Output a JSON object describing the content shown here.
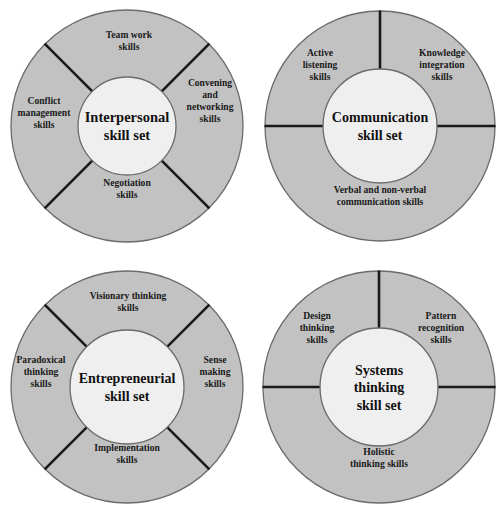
{
  "figure": {
    "kind": "skill-set-wheel-diagrams",
    "count": 4,
    "colors": {
      "ring_fill": "#c2c2c2",
      "hub_fill": "#efefef",
      "outline": "#6b6b6b",
      "divider": "#1a1a1a",
      "text": "#111111",
      "background": "#ffffff"
    }
  },
  "diagrams": [
    {
      "id": "interpersonal",
      "center_title": "Interpersonal",
      "center_subtitle": "skill set",
      "center_font_size": 14.5,
      "outer_radius": 116,
      "inner_radius": 49,
      "cx": 127,
      "cy": 126,
      "divider_angles": [
        45,
        135,
        225,
        315
      ],
      "segments": [
        {
          "name": "team-work",
          "lines": [
            "Team work",
            "skills"
          ]
        },
        {
          "name": "convening-networking",
          "lines": [
            "Convening",
            "and",
            "networking",
            "skills"
          ]
        },
        {
          "name": "negotiation",
          "lines": [
            "Negotiation",
            "skills"
          ]
        },
        {
          "name": "conflict-management",
          "lines": [
            "Conflict",
            "management",
            "skills"
          ]
        }
      ]
    },
    {
      "id": "communication",
      "center_title": "Communication",
      "center_subtitle": "skill set",
      "center_font_size": 14,
      "outer_radius": 115,
      "inner_radius": 57,
      "cx": 128,
      "cy": 126,
      "divider_angles": [
        90,
        180,
        0
      ],
      "segments": [
        {
          "name": "active-listening",
          "lines": [
            "Active",
            "listening",
            "skills"
          ]
        },
        {
          "name": "knowledge-integration",
          "lines": [
            "Knowledge",
            "integration",
            "skills"
          ]
        },
        {
          "name": "verbal-non-verbal-communication",
          "lines": [
            "Verbal and non-verbal",
            "communication skills"
          ]
        }
      ]
    },
    {
      "id": "entrepreneurial",
      "center_title": "Entrepreneurial",
      "center_subtitle": "skill set",
      "center_font_size": 14,
      "outer_radius": 116,
      "inner_radius": 57,
      "cx": 127,
      "cy": 127,
      "divider_angles": [
        45,
        135,
        225,
        315
      ],
      "segments": [
        {
          "name": "visionary-thinking",
          "lines": [
            "Visionary thinking",
            "skills"
          ]
        },
        {
          "name": "sense-making",
          "lines": [
            "Sense",
            "making",
            "skills"
          ]
        },
        {
          "name": "implementation",
          "lines": [
            "Implementation",
            "skills"
          ]
        },
        {
          "name": "paradoxical-thinking",
          "lines": [
            "Paradoxical",
            "thinking",
            "skills"
          ]
        }
      ]
    },
    {
      "id": "systems-thinking",
      "center_title": "Systems",
      "center_subtitle": "thinking",
      "center_subtitle2": "skill set",
      "center_font_size": 14,
      "outer_radius": 116,
      "inner_radius": 59,
      "cx": 127,
      "cy": 127,
      "divider_angles": [
        90,
        180,
        0
      ],
      "segments": [
        {
          "name": "design-thinking",
          "lines": [
            "Design",
            "thinking",
            "skills"
          ]
        },
        {
          "name": "pattern-recognition",
          "lines": [
            "Pattern",
            "recognition",
            "skills"
          ]
        },
        {
          "name": "holistic-thinking",
          "lines": [
            "Holistic",
            "thinking skills"
          ]
        }
      ]
    }
  ],
  "labels": {
    "d0": {
      "s0": [
        "Team work",
        "skills"
      ],
      "s1": [
        "Convening",
        "and",
        "networking",
        "skills"
      ],
      "s2": [
        "Negotiation",
        "skills"
      ],
      "s3": [
        "Conflict",
        "management",
        "skills"
      ],
      "center1": "Interpersonal",
      "center2": "skill set"
    },
    "d1": {
      "s0": [
        "Active",
        "listening",
        "skills"
      ],
      "s1": [
        "Knowledge",
        "integration",
        "skills"
      ],
      "s2": [
        "Verbal and non-verbal",
        "communication skills"
      ],
      "center1": "Communication",
      "center2": "skill set"
    },
    "d2": {
      "s0": [
        "Visionary thinking",
        "skills"
      ],
      "s1": [
        "Sense",
        "making",
        "skills"
      ],
      "s2": [
        "Implementation",
        "skills"
      ],
      "s3": [
        "Paradoxical",
        "thinking",
        "skills"
      ],
      "center1": "Entrepreneurial",
      "center2": "skill set"
    },
    "d3": {
      "s0": [
        "Design",
        "thinking",
        "skills"
      ],
      "s1": [
        "Pattern",
        "recognition",
        "skills"
      ],
      "s2": [
        "Holistic",
        "thinking skills"
      ],
      "center1": "Systems",
      "center2": "thinking",
      "center3": "skill set"
    }
  }
}
